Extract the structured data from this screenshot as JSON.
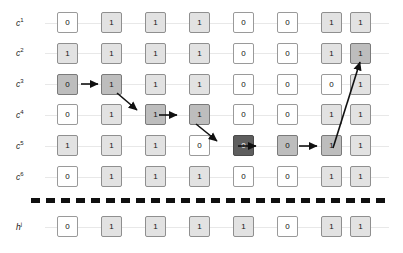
{
  "diagram": {
    "num_columns": 8,
    "row_labels": [
      "c",
      "c",
      "c",
      "c",
      "c",
      "c",
      "h"
    ],
    "rows": [
      {
        "id": "row-c1",
        "label_base": "c",
        "label_sup": "1",
        "cells": [
          {
            "value": "0",
            "shade": "white"
          },
          {
            "value": "1",
            "shade": "light"
          },
          {
            "value": "1",
            "shade": "light"
          },
          {
            "value": "1",
            "shade": "light"
          },
          {
            "value": "0",
            "shade": "white"
          },
          {
            "value": "0",
            "shade": "white"
          },
          {
            "value": "1",
            "shade": "light"
          },
          {
            "value": "1",
            "shade": "light"
          }
        ]
      },
      {
        "id": "row-c2",
        "label_base": "c",
        "label_sup": "2",
        "cells": [
          {
            "value": "1",
            "shade": "light"
          },
          {
            "value": "1",
            "shade": "light"
          },
          {
            "value": "1",
            "shade": "light"
          },
          {
            "value": "1",
            "shade": "light"
          },
          {
            "value": "0",
            "shade": "white"
          },
          {
            "value": "0",
            "shade": "white"
          },
          {
            "value": "1",
            "shade": "light"
          },
          {
            "value": "1",
            "shade": "mid"
          }
        ]
      },
      {
        "id": "row-c3",
        "label_base": "c",
        "label_sup": "3",
        "cells": [
          {
            "value": "0",
            "shade": "mid"
          },
          {
            "value": "1",
            "shade": "mid"
          },
          {
            "value": "1",
            "shade": "light"
          },
          {
            "value": "1",
            "shade": "light"
          },
          {
            "value": "0",
            "shade": "white"
          },
          {
            "value": "0",
            "shade": "white"
          },
          {
            "value": "0",
            "shade": "white"
          },
          {
            "value": "1",
            "shade": "light"
          }
        ]
      },
      {
        "id": "row-c4",
        "label_base": "c",
        "label_sup": "4",
        "cells": [
          {
            "value": "0",
            "shade": "white"
          },
          {
            "value": "1",
            "shade": "light"
          },
          {
            "value": "1",
            "shade": "mid"
          },
          {
            "value": "1",
            "shade": "mid"
          },
          {
            "value": "0",
            "shade": "white"
          },
          {
            "value": "0",
            "shade": "white"
          },
          {
            "value": "1",
            "shade": "light"
          },
          {
            "value": "1",
            "shade": "light"
          }
        ]
      },
      {
        "id": "row-c5",
        "label_base": "c",
        "label_sup": "5",
        "cells": [
          {
            "value": "1",
            "shade": "light"
          },
          {
            "value": "1",
            "shade": "light"
          },
          {
            "value": "1",
            "shade": "light"
          },
          {
            "value": "0",
            "shade": "white"
          },
          {
            "value": "0",
            "shade": "dark"
          },
          {
            "value": "0",
            "shade": "mid"
          },
          {
            "value": "1",
            "shade": "mid"
          },
          {
            "value": "1",
            "shade": "light"
          }
        ]
      },
      {
        "id": "row-c6",
        "label_base": "c",
        "label_sup": "6",
        "cells": [
          {
            "value": "0",
            "shade": "white"
          },
          {
            "value": "1",
            "shade": "light"
          },
          {
            "value": "1",
            "shade": "light"
          },
          {
            "value": "1",
            "shade": "light"
          },
          {
            "value": "0",
            "shade": "white"
          },
          {
            "value": "0",
            "shade": "white"
          },
          {
            "value": "1",
            "shade": "light"
          },
          {
            "value": "1",
            "shade": "light"
          }
        ]
      },
      {
        "id": "row-hj",
        "label_base": "h",
        "label_sup": "j",
        "cells": [
          {
            "value": "0",
            "shade": "white"
          },
          {
            "value": "1",
            "shade": "light"
          },
          {
            "value": "1",
            "shade": "light"
          },
          {
            "value": "1",
            "shade": "light"
          },
          {
            "value": "1",
            "shade": "light"
          },
          {
            "value": "0",
            "shade": "white"
          },
          {
            "value": "1",
            "shade": "light"
          },
          {
            "value": "1",
            "shade": "light"
          }
        ]
      }
    ],
    "arrows": [
      {
        "name": "arrow-c3-col1-to-col2",
        "type": "horizontal"
      },
      {
        "name": "arrow-c3-col2-to-c4-col3",
        "type": "diagonal-down"
      },
      {
        "name": "arrow-c4-col3-to-col4",
        "type": "horizontal"
      },
      {
        "name": "arrow-c4-col4-to-c5-col5",
        "type": "diagonal-down"
      },
      {
        "name": "arrow-c5-col5-to-col6",
        "type": "horizontal"
      },
      {
        "name": "arrow-c5-col6-to-col7",
        "type": "horizontal"
      },
      {
        "name": "arrow-c5-col7-to-c2-col8",
        "type": "diagonal-up"
      }
    ],
    "colors": {
      "white_cell": "#ffffff",
      "light_cell": "#e2e2e2",
      "mid_cell": "#bdbdbd",
      "dark_cell": "#5e5e5e",
      "border": "#9a9a9a",
      "guide_line": "#e8e8e8",
      "dashed_line": "#101010",
      "text": "#111111"
    }
  }
}
